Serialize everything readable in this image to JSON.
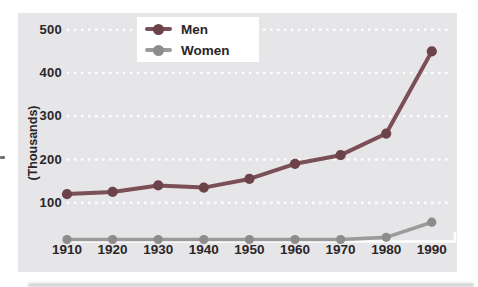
{
  "figure": {
    "background": "#ffffff",
    "plot_bg": "#e6e5e7",
    "ink": "#2a2628",
    "grid_color": "#ffffff",
    "axis_color": "#ffffff"
  },
  "chart_data": {
    "type": "line",
    "title": "",
    "xlabel": "",
    "ylabel": "(Thousands)",
    "categories": [
      "1910",
      "1920",
      "1930",
      "1940",
      "1950",
      "1960",
      "1970",
      "1980",
      "1990"
    ],
    "series": [
      {
        "name": "Men",
        "color": "#7a4f55",
        "marker_color": "#6b4349",
        "values": [
          120,
          125,
          140,
          135,
          155,
          190,
          210,
          260,
          450
        ]
      },
      {
        "name": "Women",
        "color": "#9c9a9b",
        "marker_color": "#8d8b8c",
        "values": [
          15,
          15,
          15,
          15,
          15,
          15,
          15,
          20,
          55
        ]
      }
    ],
    "y_ticks": [
      100,
      200,
      300,
      400,
      500
    ],
    "ylim": [
      0,
      520
    ],
    "grid": "horizontal white dotted lines at each y tick",
    "legend_position": "top-center inside plot, white box"
  }
}
